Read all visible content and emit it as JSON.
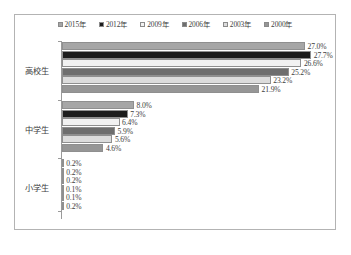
{
  "chart_data": {
    "type": "bar",
    "orientation": "horizontal",
    "title": "",
    "xlabel": "",
    "ylabel": "",
    "grid": false,
    "legend_position": "top-center",
    "axis_min": 0,
    "axis_max": 30,
    "value_suffix": "%",
    "categories": [
      "高校生",
      "中学生",
      "小学生"
    ],
    "series": [
      {
        "name": "2015年",
        "color": "#a6a6a6",
        "values": [
          27.0,
          8.0,
          0.2
        ],
        "labels": [
          "27.0%",
          "8.0%",
          "0.2%"
        ]
      },
      {
        "name": "2012年",
        "color": "#1c1c1c",
        "values": [
          27.7,
          7.3,
          0.2
        ],
        "labels": [
          "27.7%",
          "7.3%",
          "0.2%"
        ]
      },
      {
        "name": "2009年",
        "color": "#f2f2f2",
        "values": [
          26.6,
          6.4,
          0.2
        ],
        "labels": [
          "26.6%",
          "6.4%",
          "0.2%"
        ]
      },
      {
        "name": "2006年",
        "color": "#6e6e6e",
        "values": [
          25.2,
          5.9,
          0.1
        ],
        "labels": [
          "25.2%",
          "5.9%",
          "0.1%"
        ]
      },
      {
        "name": "2003年",
        "color": "#dcdcdc",
        "values": [
          23.2,
          5.6,
          0.1
        ],
        "labels": [
          "23.2%",
          "5.6%",
          "0.1%"
        ]
      },
      {
        "name": "2000年",
        "color": "#969696",
        "values": [
          21.9,
          4.6,
          0.2
        ],
        "labels": [
          "21.9%",
          "4.6%",
          "0.2%"
        ]
      }
    ]
  },
  "legend": {
    "entries": [
      {
        "label": "2015年",
        "color": "#a6a6a6"
      },
      {
        "label": "2012年",
        "color": "#1c1c1c"
      },
      {
        "label": "2009年",
        "color": "#f2f2f2"
      },
      {
        "label": "2006年",
        "color": "#6e6e6e"
      },
      {
        "label": "2003年",
        "color": "#dcdcdc"
      },
      {
        "label": "2000年",
        "color": "#969696"
      }
    ]
  },
  "style": {
    "frame_border": "#b3b3b3",
    "axis_color": "#9a9a9a",
    "text_color": "#3d3d3d",
    "background": "#ffffff"
  }
}
